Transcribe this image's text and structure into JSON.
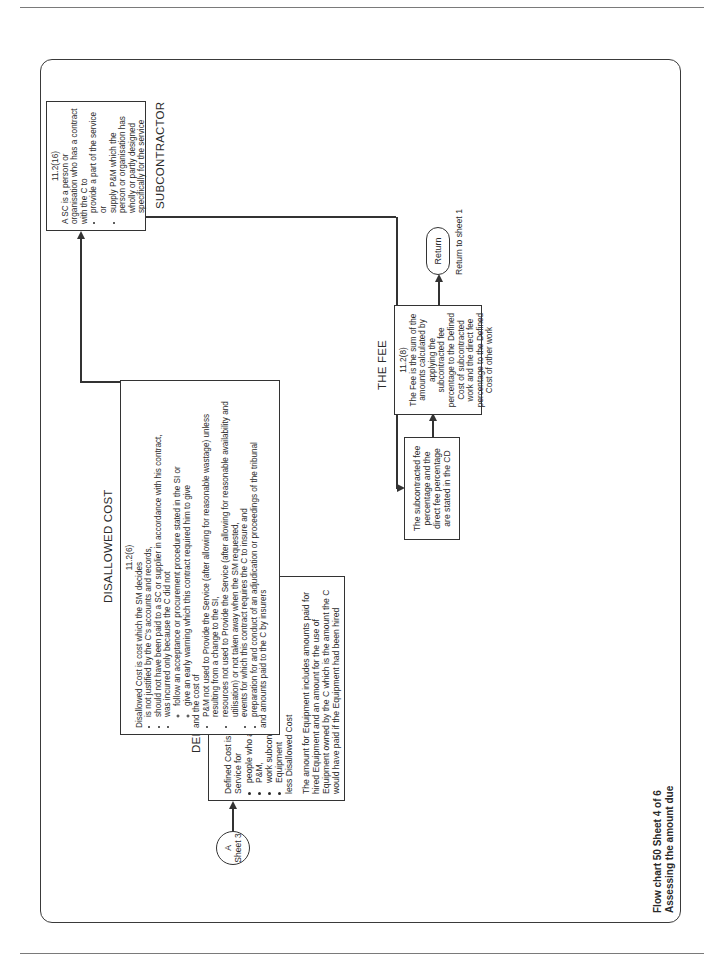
{
  "document": {
    "caption": {
      "line1": "Flow chart 50  Sheet 4 of 6",
      "line2": "Assessing the amount due"
    }
  },
  "flowchart": {
    "start_connector": {
      "letter": "A",
      "label": "Sheet 3"
    },
    "defined_cost": {
      "heading": "DEFINED COST",
      "ref": "11.2(5)",
      "intro": "Defined Cost is payments by the C in Providing the Service for",
      "bullets": [
        "people who are employed by the C,",
        "P&M,",
        "work subcontracted by the C and",
        "Equipment"
      ],
      "less": "less Disallowed Cost",
      "equipment_note": "The amount for Equipment includes amounts paid for hired Equipment and an amount for the use of Equipment owned by the C which is the amount the C would have paid if the Equipment had been hired"
    },
    "disallowed_cost": {
      "heading": "DISALLOWED COST",
      "ref": "11.2(6)",
      "intro": "Disallowed Cost is cost which the SM decides",
      "bullets": [
        "is not justified by the C's accounts and records,",
        "should not have been paid to a SC or supplier in accordance with his contract,",
        "was incurred only because the C did not"
      ],
      "sub_bullets": [
        "follow an acceptance or procurement procedure stated in the SI or",
        "give an early warning which this contract required him to give"
      ],
      "and_cost_of": "and the cost of",
      "bullets2": [
        "P&M not used to Provide the Service (after allowing for reasonable wastage) unless resulting from a change to the SI,",
        "resources not used to Provide the Service (after allowing for reasonable availability and utilisation) or not taken away when the SM requested,",
        "events for which this contract requires the C to insure and",
        "preparation for and conduct of an adjudication or proceedings of the tribunal"
      ],
      "closing": "and amounts paid to the C by insurers"
    },
    "subcontractor": {
      "heading": "SUBCONTRACTOR",
      "ref": "11.2(16)",
      "intro": "A SC is a person or organisation who has a contract with the C to",
      "bullets": [
        "provide a part of the service or",
        "supply P&M which the person or organisation has wholly or partly designed specifically for the service"
      ]
    },
    "fee_percentages": {
      "text": "The subcontracted fee percentage and the direct fee percentage are stated in the CD"
    },
    "the_fee": {
      "heading": "THE FEE",
      "ref": "11.2(8)",
      "text": "The Fee is the sum of the amounts calculated by applying the subcontracted fee percentage to the Defined Cost of subcontracted work and the direct fee percentage to the Defined Cost of other work"
    },
    "return": {
      "label": "Return",
      "note": "Return to sheet 1"
    }
  },
  "colors": {
    "line": "#333333",
    "text": "#2a2a2a",
    "background": "#ffffff"
  }
}
